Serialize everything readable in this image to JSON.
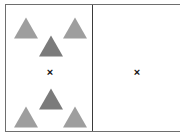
{
  "figure": {
    "name": "two-panel-triangle-search-display",
    "width": 186,
    "height": 139,
    "background_color": "#ffffff",
    "frame": {
      "border_color": "#6e6e6e",
      "divider_color": "#3a3a3a",
      "x": 5,
      "y": 4,
      "width": 175,
      "height": 128
    },
    "panels": [
      {
        "id": "left",
        "name": "left-panel",
        "x": 0,
        "width": 87,
        "fixation": {
          "symbol": "×",
          "x": 44,
          "y": 67,
          "color": "#111111"
        },
        "groups": [
          {
            "name": "top-triangle-group",
            "triangles": [
              {
                "role": "distractor",
                "shade": "light",
                "color": "#9e9e9e",
                "outline": "#8a8a8a",
                "cx": 20,
                "cy": 23,
                "width": 24,
                "height": 21
              },
              {
                "role": "distractor",
                "shade": "light",
                "color": "#9e9e9e",
                "outline": "#8a8a8a",
                "cx": 69,
                "cy": 23,
                "width": 24,
                "height": 21
              },
              {
                "role": "target",
                "shade": "dark",
                "color": "#7b7b7b",
                "outline": "#6c6c6c",
                "cx": 45,
                "cy": 41,
                "width": 24,
                "height": 21
              }
            ]
          },
          {
            "name": "bottom-triangle-group",
            "triangles": [
              {
                "role": "target",
                "shade": "dark",
                "color": "#7b7b7b",
                "outline": "#6c6c6c",
                "cx": 45,
                "cy": 94,
                "width": 24,
                "height": 21
              },
              {
                "role": "distractor",
                "shade": "light",
                "color": "#9e9e9e",
                "outline": "#8a8a8a",
                "cx": 20,
                "cy": 112,
                "width": 24,
                "height": 21
              },
              {
                "role": "distractor",
                "shade": "light",
                "color": "#9e9e9e",
                "outline": "#8a8a8a",
                "cx": 69,
                "cy": 112,
                "width": 24,
                "height": 21
              }
            ]
          }
        ]
      },
      {
        "id": "right",
        "name": "right-panel",
        "x": 87,
        "width": 88,
        "fixation": {
          "symbol": "×",
          "x": 44,
          "y": 67,
          "color": "#111111"
        },
        "groups": []
      }
    ]
  }
}
